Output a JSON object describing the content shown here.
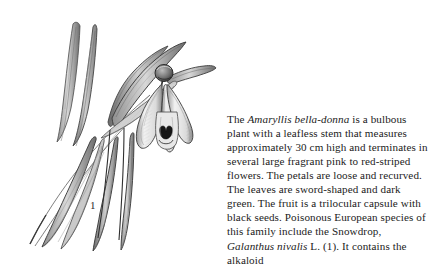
{
  "figure": {
    "label": "1",
    "caption_subject": "Galanthus nivalis",
    "illustration_name": "snowdrop-botanical-illustration",
    "ink_color": "#3a3a3a",
    "background_color": "#ffffff"
  },
  "body_text": {
    "segments": [
      {
        "text": "The ",
        "style": "normal"
      },
      {
        "text": "Amaryllis bella-donna",
        "style": "italic"
      },
      {
        "text": " is a bulbous plant with a leafless stem that measures approximately 30 cm high and terminates in several large fragrant pink to red-striped flowers. The petals are loose and recurved. The leaves are sword-shaped and dark green. The fruit is a trilocular capsule with black seeds. Poisonous European species of this family include the Snowdrop, ",
        "style": "normal"
      },
      {
        "text": "Galanthus nivalis",
        "style": "italic"
      },
      {
        "text": " L. (1). It contains the alkaloid",
        "style": "normal"
      }
    ],
    "full_text": "The Amaryllis bella-donna is a bulbous plant with a leafless stem that measures approximately 30 cm high and terminates in several large fragrant pink to red-striped flowers. The petals are loose and recurved. The leaves are sword-shaped and dark green. The fruit is a trilocular capsule with black seeds. Poisonous European species of this family include the Snowdrop, Galanthus nivalis L. (1). It contains the alkaloid"
  }
}
